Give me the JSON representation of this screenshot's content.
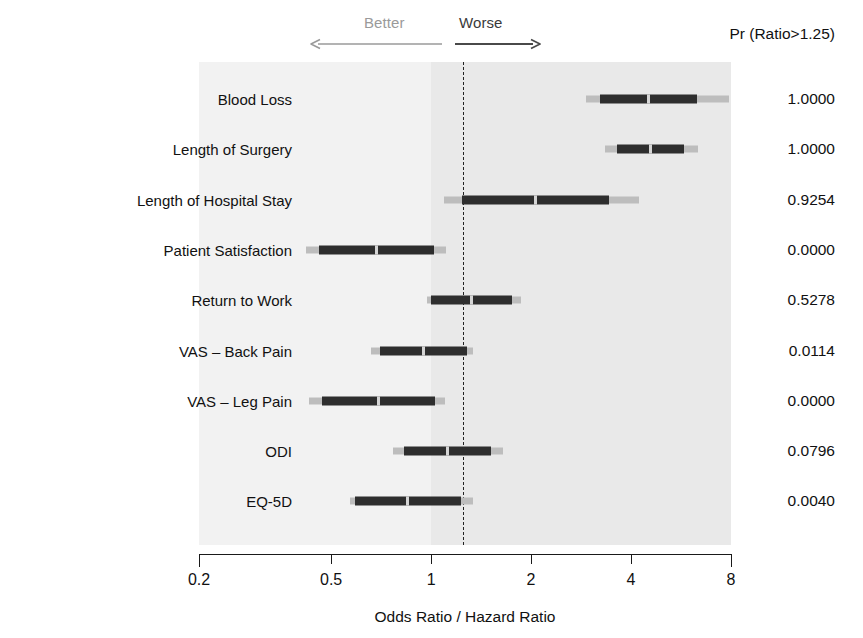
{
  "chart_data": {
    "type": "bar",
    "chart_kind": "forest-plot",
    "title": "",
    "xlabel": "Odds Ratio / Hazard Ratio",
    "ylabel": "",
    "xscale": "log",
    "xlim": [
      0.2,
      8
    ],
    "xticks": [
      0.2,
      0.5,
      1,
      2,
      4,
      8
    ],
    "xtick_labels": [
      "0.2",
      "0.5",
      "1",
      "2",
      "4",
      "8"
    ],
    "grid": false,
    "legend": "none",
    "reference_line": 1.25,
    "reference_line_style": "dash-dot",
    "annotations": {
      "better_label": "Better",
      "worse_label": "Worse",
      "better_color": "#9a9a9a",
      "worse_color": "#3a3a3a",
      "prob_header": "Pr (Ratio>1.25)"
    },
    "categories": [
      "Blood Loss",
      "Length of Surgery",
      "Length of Hospital Stay",
      "Patient Satisfaction",
      "Return to Work",
      "VAS – Back Pain",
      "VAS – Leg Pain",
      "ODI",
      "EQ-5D"
    ],
    "series": [
      {
        "name": "Ratio estimate with 50% and 95% credible intervals",
        "ci95_low": [
          2.93,
          3.35,
          1.09,
          0.42,
          0.97,
          0.66,
          0.43,
          0.77,
          0.57
        ],
        "ci50_low": [
          3.22,
          3.62,
          1.24,
          0.46,
          1.0,
          0.7,
          0.47,
          0.83,
          0.59
        ],
        "ci50_high": [
          6.32,
          5.77,
          3.44,
          1.02,
          1.75,
          1.28,
          1.03,
          1.51,
          1.23
        ],
        "ci95_high": [
          7.9,
          6.35,
          4.22,
          1.11,
          1.86,
          1.34,
          1.1,
          1.65,
          1.34
        ]
      }
    ],
    "probabilities": [
      "1.0000",
      "1.0000",
      "0.9254",
      "0.0000",
      "0.5278",
      "0.0114",
      "0.0000",
      "0.0796",
      "0.0040"
    ]
  },
  "axis": {
    "x_title": "Odds Ratio / Hazard Ratio"
  }
}
